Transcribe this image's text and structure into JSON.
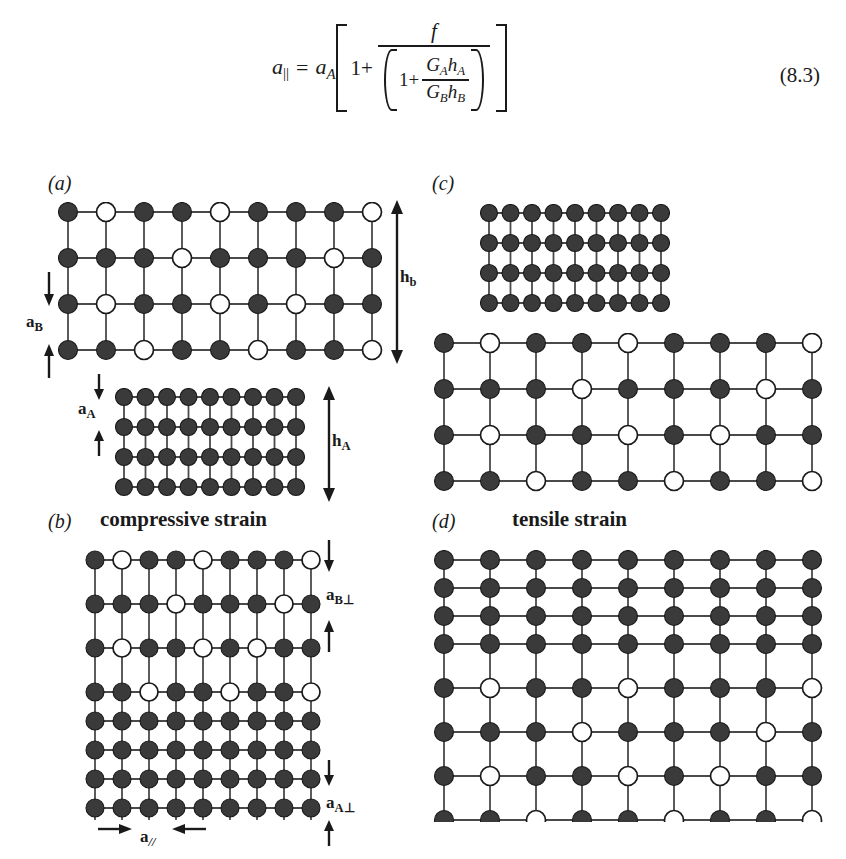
{
  "equation": {
    "lhs_a": "a",
    "lhs_sub": "||",
    "equals": "=",
    "rhs_a": "a",
    "rhs_sub": "A",
    "one": "1+",
    "numerator": "f",
    "den_one": "1+",
    "den_num_G": "G",
    "den_num_G_sub": "A",
    "den_num_h": "h",
    "den_num_h_sub": "A",
    "den_den_G": "G",
    "den_den_G_sub": "B",
    "den_den_h": "h",
    "den_den_h_sub": "B",
    "number": "(8.3)",
    "plain_text": "a|| = aA [ 1 + f / ( 1 + GA hA / GB hB ) ]"
  },
  "figure": {
    "panels": [
      {
        "id": "a",
        "letter": "(a)",
        "heading": "",
        "labels": [
          {
            "name": "a-B",
            "text_main": "a",
            "text_sub": "B"
          },
          {
            "name": "h-b",
            "text_main": "h",
            "text_sub": "b"
          },
          {
            "name": "a-A",
            "text_main": "a",
            "text_sub": "A"
          },
          {
            "name": "h-A",
            "text_main": "h",
            "text_sub": "A"
          }
        ],
        "lattices": [
          {
            "name": "alloy-layer-relaxed",
            "cols": 9,
            "rows": 4,
            "fill": "mixed"
          },
          {
            "name": "substrate-layer-relaxed",
            "cols": 9,
            "rows": 4,
            "fill": "all-filled"
          }
        ]
      },
      {
        "id": "b",
        "letter": "(b)",
        "heading": "compressive strain",
        "labels": [
          {
            "name": "a-B-perp",
            "text_main": "a",
            "text_sub": "B⊥"
          },
          {
            "name": "a-A-perp",
            "text_main": "a",
            "text_sub": "A⊥"
          },
          {
            "name": "a-parallel",
            "text_main": "a",
            "text_sub": "//"
          }
        ],
        "lattices": [
          {
            "name": "alloy-layer-strained",
            "cols": 9,
            "rows": 4,
            "fill": "mixed"
          },
          {
            "name": "substrate-layer-strained",
            "cols": 9,
            "rows": 4,
            "fill": "all-filled"
          }
        ]
      },
      {
        "id": "c",
        "letter": "(c)",
        "heading": "",
        "labels": [],
        "lattices": [
          {
            "name": "substrate-layer-relaxed",
            "cols": 9,
            "rows": 4,
            "fill": "all-filled"
          },
          {
            "name": "alloy-layer-relaxed",
            "cols": 9,
            "rows": 4,
            "fill": "mixed"
          }
        ]
      },
      {
        "id": "d",
        "letter": "(d)",
        "heading": "tensile strain",
        "labels": [],
        "lattices": [
          {
            "name": "substrate-layer-strained",
            "cols": 9,
            "rows": 4,
            "fill": "all-filled"
          },
          {
            "name": "alloy-layer-strained",
            "cols": 9,
            "rows": 4,
            "fill": "mixed"
          }
        ]
      }
    ],
    "open_circle_pattern": [
      [
        1,
        4,
        8
      ],
      [
        3,
        7
      ],
      [
        1,
        4,
        6
      ],
      [
        2,
        5,
        8
      ]
    ],
    "colors": {
      "atom_filled": "#3a3a3a",
      "atom_open_fill": "#ffffff",
      "atom_stroke": "#1a1a1a",
      "bond": "#4a4a4a",
      "text": "#1a1a1a",
      "background": "#ffffff"
    }
  }
}
